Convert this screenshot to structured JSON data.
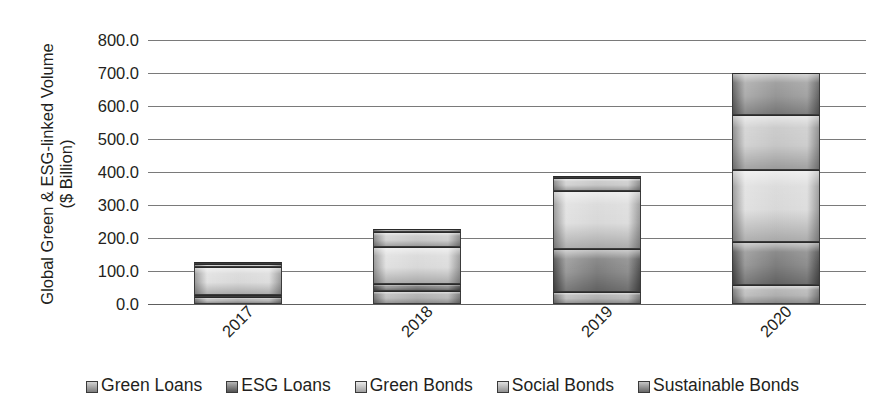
{
  "chart_data": {
    "type": "bar",
    "subtype": "stacked-vertical",
    "title": "",
    "xlabel": "",
    "ylabel": "Global Green & ESG-linked Volume ($ Billion)",
    "ylabel_lines": [
      "Global Green & ESG-linked Volume",
      "($ Billion)"
    ],
    "categories": [
      "2017",
      "2018",
      "2019",
      "2020"
    ],
    "ylim": [
      0,
      800
    ],
    "ytick_values": [
      0,
      100,
      200,
      300,
      400,
      500,
      600,
      700,
      800
    ],
    "ytick_labels": [
      "0.0",
      "100.0",
      "200.0",
      "300.0",
      "400.0",
      "500.0",
      "600.0",
      "700.0",
      "800.0"
    ],
    "grid": true,
    "legend_position": "bottom",
    "series": [
      {
        "name": "Green Loans",
        "color": "#a6a6a6",
        "values": [
          22.0,
          38.0,
          37.0,
          58.0
        ]
      },
      {
        "name": "ESG Loans",
        "color": "#6e6e6e",
        "values": [
          6.0,
          22.0,
          131.0,
          131.0
        ]
      },
      {
        "name": "Green Bonds",
        "color": "#d4d4d4",
        "values": [
          84.0,
          112.0,
          174.0,
          217.0
        ]
      },
      {
        "name": "Social Bonds",
        "color": "#c0c0c0",
        "values": [
          8.0,
          45.0,
          41.0,
          167.0
        ]
      },
      {
        "name": "Sustainable Bonds",
        "color": "#8a8a8a",
        "values": [
          8.0,
          11.0,
          5.0,
          127.0
        ]
      }
    ],
    "totals": [
      128.0,
      228.0,
      388.0,
      700.0
    ]
  },
  "legend": {
    "items": [
      {
        "label": "Green Loans"
      },
      {
        "label": "ESG Loans"
      },
      {
        "label": "Green Bonds"
      },
      {
        "label": "Social Bonds"
      },
      {
        "label": "Sustainable Bonds"
      }
    ]
  },
  "icons": {
    "legend_swatch": "square-swatch-icon"
  }
}
